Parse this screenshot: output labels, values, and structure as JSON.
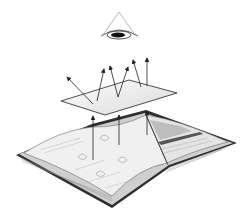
{
  "figure": {
    "elements": [
      "eye",
      "transparent-sheet",
      "light-ray-arrows",
      "open-book"
    ]
  },
  "colors": {
    "stroke": "#222222",
    "sheet_fill": "#f2f2f2",
    "page_fill": "#eeeeee",
    "cover": "#333333",
    "pupil": "#111111"
  }
}
